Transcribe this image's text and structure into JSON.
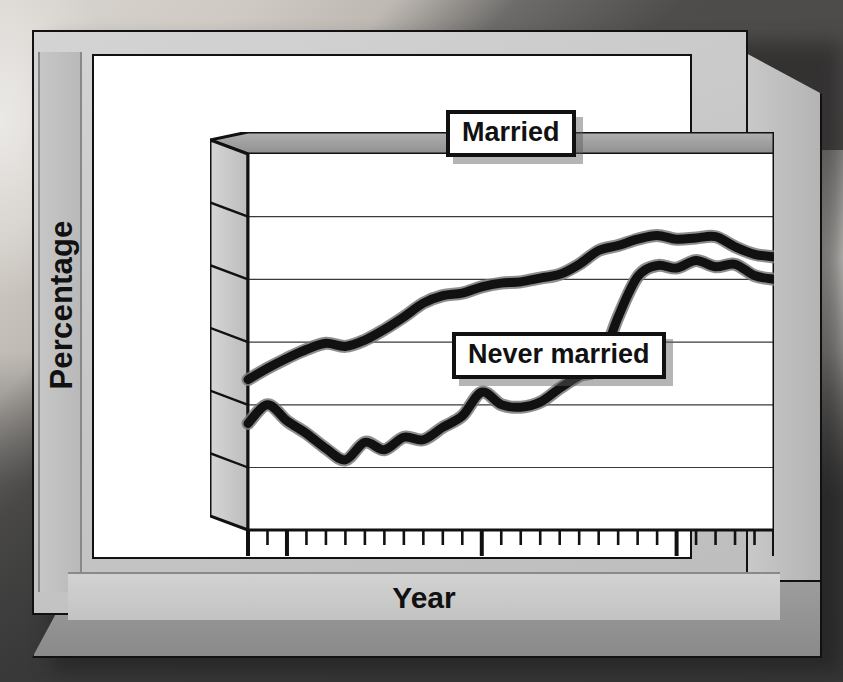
{
  "chart_data": {
    "type": "line",
    "title": "",
    "xlabel": "Year",
    "ylabel": "Percentage",
    "xlim": [
      1978,
      2005
    ],
    "ylim": [
      20,
      80
    ],
    "yticks": [
      30,
      40,
      50,
      60,
      70,
      80
    ],
    "xticks_labeled": [
      1978,
      1980,
      1990,
      2000,
      2005
    ],
    "xtick_minor_step": 1,
    "grid": "horizontal",
    "legend_position": "inline-callout",
    "x": [
      1978,
      1979,
      1980,
      1981,
      1982,
      1983,
      1984,
      1985,
      1986,
      1987,
      1988,
      1989,
      1990,
      1991,
      1992,
      1993,
      1994,
      1995,
      1996,
      1997,
      1998,
      1999,
      2000,
      2001,
      2002,
      2003,
      2004,
      2005
    ],
    "series": [
      {
        "name": "Married",
        "values": [
          44.0,
          45.8,
          47.4,
          48.8,
          49.8,
          49.3,
          50.3,
          52.0,
          54.0,
          56.2,
          57.4,
          57.8,
          58.8,
          59.4,
          59.6,
          60.2,
          60.8,
          62.4,
          64.6,
          65.4,
          66.4,
          67.0,
          66.4,
          66.6,
          66.8,
          65.2,
          64.0,
          63.6
        ]
      },
      {
        "name": "Never married",
        "values": [
          37.0,
          40.0,
          37.4,
          35.4,
          33.0,
          31.2,
          34.0,
          32.8,
          34.8,
          34.4,
          36.4,
          38.2,
          42.0,
          40.0,
          39.6,
          40.4,
          42.6,
          44.6,
          46.0,
          54.0,
          60.4,
          62.2,
          61.8,
          63.0,
          62.0,
          62.4,
          60.6,
          60.0
        ]
      }
    ],
    "annotations": [
      {
        "name": "Married",
        "text": "Married"
      },
      {
        "name": "Never married",
        "text": "Never married"
      }
    ],
    "colors": {
      "line": "#111111",
      "halo": "#7a7a7a",
      "plot_bg": "#ffffff",
      "frame": "#c0c0c0"
    }
  },
  "axes": {
    "y_title": "Percentage",
    "x_title": "Year",
    "y_tick_labels": [
      "80",
      "70",
      "60",
      "50",
      "40",
      "30"
    ],
    "x_tick_labels": [
      "1978",
      "1980",
      "1990",
      "2000",
      "2005"
    ]
  },
  "labels": {
    "married": "Married",
    "never_married": "Never married"
  }
}
